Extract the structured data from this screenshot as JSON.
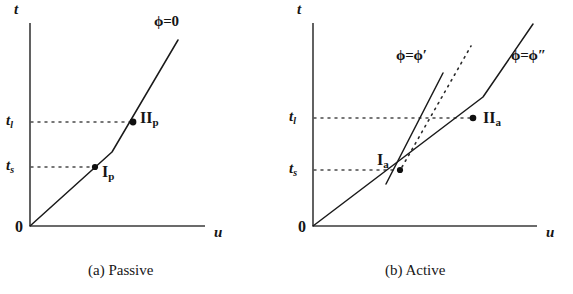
{
  "figure": {
    "panels": [
      {
        "id": "passive",
        "caption": "(a) Passive",
        "caption_x": 88,
        "caption_y": 262,
        "axes": {
          "origin_label": "0",
          "x_axis_label": "u",
          "y_axis_label": "t",
          "x0": 30,
          "y0": 226,
          "x1": 205,
          "y1": 23
        },
        "ticks": [
          {
            "label": "t",
            "sub": "l",
            "value_y": 122,
            "label_x": 6,
            "label_y": 113
          },
          {
            "label": "t",
            "sub": "s",
            "value_y": 167,
            "label_x": 6,
            "label_y": 158
          }
        ],
        "curves": [
          {
            "name": "phi-zero-curve",
            "style": "solid",
            "points": "30,226 112,152 178,40"
          }
        ],
        "curve_labels": [
          {
            "name": "phi-equals-zero",
            "text": "ϕ=0",
            "x": 154,
            "y": 14
          }
        ],
        "points": [
          {
            "name": "point-I-p",
            "x": 95,
            "y": 167,
            "label": "I",
            "sub": "p",
            "label_x": 102,
            "label_y": 164
          },
          {
            "name": "point-II-p",
            "x": 133,
            "y": 122,
            "label": "II",
            "sub": "p",
            "label_x": 140,
            "label_y": 110
          }
        ]
      },
      {
        "id": "active",
        "caption": "(b) Active",
        "caption_x": 385,
        "caption_y": 262,
        "axes": {
          "origin_label": "0",
          "x_axis_label": "u",
          "y_axis_label": "t",
          "x0": 313,
          "y0": 226,
          "x1": 537,
          "y1": 23
        },
        "ticks": [
          {
            "label": "t",
            "sub": "l",
            "value_y": 118,
            "label_x": 289,
            "label_y": 109
          },
          {
            "label": "t",
            "sub": "s",
            "value_y": 170,
            "label_x": 289,
            "label_y": 161
          }
        ],
        "curves": [
          {
            "name": "phi-double-prime-curve",
            "style": "solid",
            "points": "313,226 483,97 533,24"
          },
          {
            "name": "phi-prime-curve",
            "style": "solid",
            "points": "386,184 443,73"
          },
          {
            "name": "phi-prime-dotted-extension",
            "style": "dotted",
            "points": "402,167 471,46"
          }
        ],
        "curve_labels": [
          {
            "name": "phi-equals-phi-prime",
            "text": "ϕ=ϕ′",
            "x": 396,
            "y": 48
          },
          {
            "name": "phi-equals-phi-double-prime",
            "text": "ϕ=ϕ″",
            "x": 511,
            "y": 48
          }
        ],
        "points": [
          {
            "name": "point-I-a",
            "x": 400,
            "y": 170,
            "label": "I",
            "sub": "a",
            "label_x": 377,
            "label_y": 152
          },
          {
            "name": "point-II-a",
            "x": 473,
            "y": 118,
            "label": "II",
            "sub": "a",
            "label_x": 483,
            "label_y": 110
          }
        ]
      }
    ],
    "colors": {
      "ink": "#151515",
      "axis": "#3a3a3a",
      "dotted": "#4a4a4a",
      "background": "#ffffff"
    }
  }
}
